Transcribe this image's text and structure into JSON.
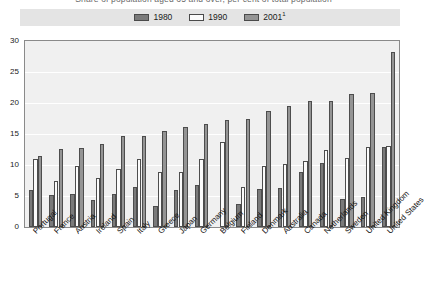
{
  "top_caption": "Share of population aged 65 and over, per cent of total population",
  "legend": {
    "items": [
      {
        "label": "1980",
        "color": "#7a7a7a",
        "key": "y1980"
      },
      {
        "label": "1990",
        "color": "#fbfbfb",
        "key": "y1990"
      },
      {
        "label": "2001",
        "color": "#949494",
        "key": "y2001",
        "superscript": "1"
      }
    ]
  },
  "chart_data": {
    "type": "bar",
    "title": "",
    "xlabel": "",
    "ylabel": "",
    "ylim": [
      0,
      30
    ],
    "yticks": [
      0,
      5,
      10,
      15,
      20,
      25,
      30
    ],
    "grid": true,
    "legend_position": "top",
    "categories": [
      "Portugal",
      "France",
      "Austria",
      "Ireland",
      "Spain",
      "Italy",
      "Greece",
      "Japan",
      "Germany",
      "Belgium",
      "Finland",
      "Denmark",
      "Australia",
      "Canada",
      "Netherlands",
      "Sweden",
      "United Kingdom",
      "United States"
    ],
    "series": [
      {
        "name": "1980",
        "color": "#7a7a7a",
        "values": [
          5.9,
          5.1,
          5.4,
          4.3,
          5.3,
          6.4,
          3.4,
          6.0,
          6.8,
          null,
          3.7,
          6.1,
          6.3,
          8.8,
          10.3,
          4.5,
          4.8,
          12.9
        ]
      },
      {
        "name": "1990",
        "color": "#fbfbfb",
        "values": [
          11.0,
          7.5,
          9.9,
          7.9,
          9.4,
          10.9,
          8.8,
          8.9,
          11.0,
          13.7,
          6.4,
          9.9,
          10.2,
          10.7,
          12.5,
          11.1,
          12.9,
          13.1
        ]
      },
      {
        "name": "2001",
        "color": "#949494",
        "values": [
          11.5,
          12.6,
          12.8,
          13.4,
          14.7,
          14.6,
          15.5,
          16.2,
          16.6,
          17.3,
          17.5,
          18.7,
          19.5,
          20.3,
          20.4,
          21.4,
          21.6,
          28.2
        ]
      }
    ]
  }
}
